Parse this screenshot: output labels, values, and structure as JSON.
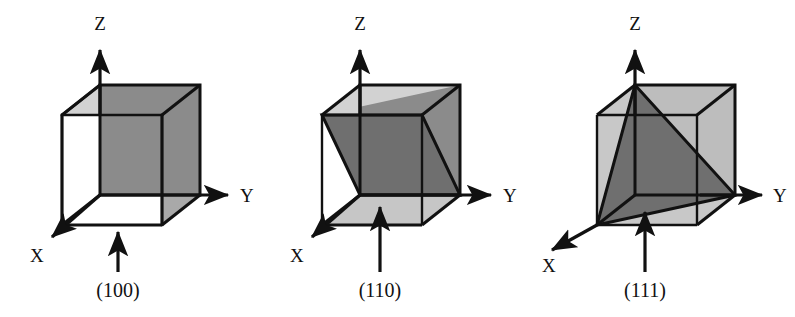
{
  "figure": {
    "background_color": "#ffffff",
    "line_color": "#111111",
    "face_colors": {
      "top_light": "#d2d2d2",
      "front_dark": "#8b8b8b",
      "right_mid": "#a9a9a9",
      "plane_dark": "#6f6f6f",
      "plane_light": "#c6c6c6"
    }
  },
  "panels": [
    {
      "id": "panel-100",
      "plane_label": "(100)",
      "axes": {
        "z": "Z",
        "y": "Y",
        "x": "X"
      }
    },
    {
      "id": "panel-110",
      "plane_label": "(110)",
      "axes": {
        "z": "Z",
        "y": "Y",
        "x": "X"
      }
    },
    {
      "id": "panel-111",
      "plane_label": "(111)",
      "axes": {
        "z": "Z",
        "y": "Y",
        "x": "X"
      }
    }
  ]
}
